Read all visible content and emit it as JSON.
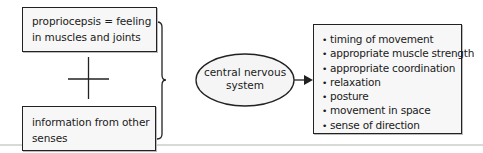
{
  "diagram": {
    "inputs": [
      {
        "id": "proprioception",
        "text": "proprioceps​is = feeling in muscles and joints"
      },
      {
        "id": "other-senses",
        "text": "information from other senses"
      }
    ],
    "combiner_symbol": "+",
    "center": {
      "text": "central nervous system"
    },
    "outputs": {
      "bullet": "•",
      "items": [
        "timing of movement",
        "appropriate muscle strength",
        "appropriate coordination",
        "relaxation",
        "posture",
        "movement in space",
        "sense of direction"
      ]
    },
    "colors": {
      "line": "#222222",
      "box_fill": "#f7f7f7",
      "ellipse_fill": "#f5f5f5"
    }
  }
}
